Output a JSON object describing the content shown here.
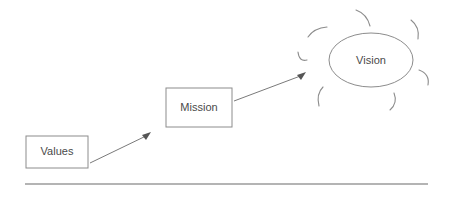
{
  "diagram": {
    "background_color": "#ffffff",
    "stroke_color": "#8c8c8c",
    "text_color": "#4a4a4a",
    "baseline_color": "#b4b4b4",
    "nodes": [
      {
        "id": "values",
        "label": "Values",
        "shape": "rectangle",
        "x": 26,
        "y": 136,
        "width": 62,
        "height": 32
      },
      {
        "id": "mission",
        "label": "Mission",
        "shape": "rectangle",
        "x": 166,
        "y": 88,
        "width": 66,
        "height": 39
      },
      {
        "id": "vision",
        "label": "Vision",
        "shape": "ellipse",
        "cx": 371,
        "cy": 60,
        "rx": 42,
        "ry": 27
      }
    ],
    "connectors": [
      {
        "id": "values-to-mission",
        "from": "values",
        "to": "mission",
        "x1": 90,
        "y1": 163,
        "x2": 150,
        "y2": 134
      },
      {
        "id": "mission-to-vision",
        "from": "mission",
        "to": "vision",
        "x1": 234,
        "y1": 101,
        "x2": 305,
        "y2": 73
      }
    ],
    "sun_rays": {
      "id": "vision-sun-rays",
      "count": 7,
      "description": "short curved arcs radiating around the Vision ellipse"
    },
    "baseline": {
      "id": "baseline-rule",
      "x1": 25,
      "y1": 184,
      "x2": 428,
      "y2": 184
    }
  }
}
